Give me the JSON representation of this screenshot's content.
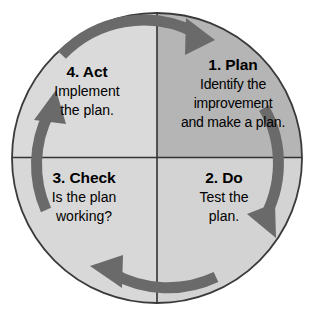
{
  "diagram": {
    "name": "PDCA cycle",
    "shape": "circle divided into four quadrants with four clockwise arrows",
    "rotation_direction": "clockwise",
    "colors": {
      "background": "#ffffff",
      "circle_outline": "#3a3a3a",
      "divider_line": "#333333",
      "quadrant_plan_fill": "#b5b5b5",
      "quadrant_do_fill": "#d3d3d3",
      "quadrant_check_fill": "#d8d8d8",
      "quadrant_act_fill": "#dadada",
      "arrow_fill": "#6a6a6a",
      "text": "#000000"
    },
    "geometry": {
      "center_x": 157,
      "center_y": 158,
      "radius": 145
    }
  },
  "quadrants": [
    {
      "id": "plan",
      "position": "top-right",
      "heading": "1. Plan",
      "body_lines": [
        "Identify the",
        "improvement",
        "and make a plan."
      ]
    },
    {
      "id": "do",
      "position": "bottom-right",
      "heading": "2. Do",
      "body_lines": [
        "Test the",
        "plan."
      ]
    },
    {
      "id": "check",
      "position": "bottom-left",
      "heading": "3. Check",
      "body_lines": [
        "Is the plan",
        "working?"
      ]
    },
    {
      "id": "act",
      "position": "top-left",
      "heading": "4. Act",
      "body_lines": [
        "Implement",
        "the plan."
      ]
    }
  ],
  "arrows": [
    {
      "id": "arrow-top",
      "name": "arrow-act-to-plan",
      "direction": "clockwise, pointing right"
    },
    {
      "id": "arrow-right",
      "name": "arrow-plan-to-do",
      "direction": "clockwise, pointing down"
    },
    {
      "id": "arrow-bottom",
      "name": "arrow-do-to-check",
      "direction": "clockwise, pointing left"
    },
    {
      "id": "arrow-left",
      "name": "arrow-check-to-act",
      "direction": "clockwise, pointing up"
    }
  ]
}
